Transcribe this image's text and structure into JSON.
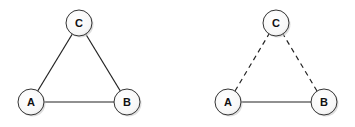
{
  "diagrams": [
    {
      "name": "complete-triangle",
      "nodes": [
        {
          "id": "A",
          "label": "A",
          "x": 31,
          "y": 102
        },
        {
          "id": "B",
          "label": "B",
          "x": 127,
          "y": 102
        },
        {
          "id": "C",
          "label": "C",
          "x": 79,
          "y": 23
        }
      ],
      "edges": [
        {
          "from": "A",
          "to": "B",
          "style": "solid"
        },
        {
          "from": "A",
          "to": "C",
          "style": "solid"
        },
        {
          "from": "B",
          "to": "C",
          "style": "solid"
        }
      ]
    },
    {
      "name": "partial-triangle",
      "nodes": [
        {
          "id": "A",
          "label": "A",
          "x": 228,
          "y": 102
        },
        {
          "id": "B",
          "label": "B",
          "x": 324,
          "y": 102
        },
        {
          "id": "C",
          "label": "C",
          "x": 276,
          "y": 23
        }
      ],
      "edges": [
        {
          "from": "A",
          "to": "B",
          "style": "solid"
        },
        {
          "from": "A",
          "to": "C",
          "style": "dashed"
        },
        {
          "from": "B",
          "to": "C",
          "style": "dashed"
        }
      ]
    }
  ],
  "style": {
    "node_radius": 13,
    "stroke_color": "#222222",
    "node_fill": "#ffffff",
    "shadow_color": "#bbbbbb"
  }
}
